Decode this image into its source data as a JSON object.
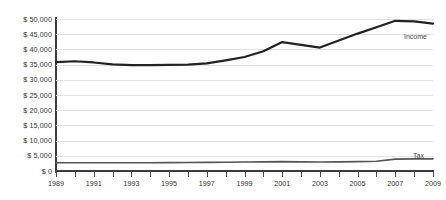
{
  "chart_data": {
    "type": "line",
    "title": "",
    "subtitle": "",
    "xlabel": "",
    "ylabel": "",
    "xlim": [
      1989,
      2009
    ],
    "ylim": [
      0,
      50000
    ],
    "grid": true,
    "legend_position": "inline-right-end-of-series",
    "x": [
      1989,
      1990,
      1991,
      1992,
      1993,
      1994,
      1995,
      1996,
      1997,
      1998,
      1999,
      2000,
      2001,
      2002,
      2003,
      2004,
      2005,
      2006,
      2007,
      2008,
      2009
    ],
    "x_tick_labels": [
      "1989",
      "",
      "1991",
      "",
      "1993",
      "",
      "1995",
      "",
      "1997",
      "",
      "1999",
      "",
      "2001",
      "",
      "2003",
      "",
      "2005",
      "",
      "2007",
      "",
      "2009"
    ],
    "y_tick_labels": [
      "$ 50,000",
      "$ 45,000",
      "$ 40,000",
      "$ 35,000",
      "$ 30,000",
      "$ 25,000",
      "$ 20,000",
      "$ 15,000",
      "$ 10,000",
      "$ 5,000",
      "$ 0"
    ],
    "y_tick_values": [
      50000,
      45000,
      40000,
      35000,
      30000,
      25000,
      20000,
      15000,
      10000,
      5000,
      0
    ],
    "series": [
      {
        "name": "Income",
        "color": "#222222",
        "values": [
          35800,
          36100,
          35700,
          35100,
          34800,
          34800,
          34900,
          35000,
          35400,
          36400,
          37500,
          39400,
          42400,
          41500,
          40600,
          42900,
          45200,
          47300,
          49400,
          49200,
          48500
        ]
      },
      {
        "name": "Tax",
        "color": "#555555",
        "values": [
          2700,
          2700,
          2700,
          2700,
          2700,
          2700,
          2750,
          2800,
          2850,
          2900,
          2950,
          3000,
          3100,
          3000,
          2950,
          3000,
          3100,
          3200,
          3900,
          4000,
          4000
        ]
      }
    ]
  }
}
